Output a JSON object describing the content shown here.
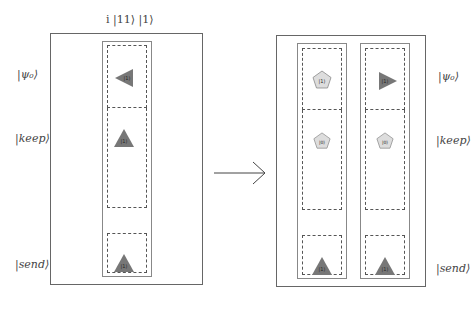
{
  "title": "i |11⟩ |1⟩",
  "row_labels": {
    "psi0": "|ψ₀⟩",
    "keep": "|keep⟩",
    "send": "|send⟩"
  },
  "colors": {
    "triangle_fill": "#777777",
    "pentagon_fill": "#dddddd",
    "pentagon_stroke": "#888888",
    "frame": "#666666"
  },
  "before": {
    "column": {
      "psi0": {
        "shape": "triangle-left",
        "label": "|1⟩"
      },
      "keep": {
        "shape": "triangle-up",
        "label": "|1⟩"
      },
      "send": {
        "shape": "triangle-up",
        "label": "|1⟩"
      }
    }
  },
  "arrow": {
    "direction": "right"
  },
  "after": {
    "columns": [
      {
        "psi0": {
          "shape": "pentagon",
          "label": "|1⟩"
        },
        "keep": {
          "shape": "pentagon",
          "label": "|0⟩"
        },
        "send": {
          "shape": "triangle-up",
          "label": "|1⟩"
        }
      },
      {
        "psi0": {
          "shape": "triangle-right",
          "label": "|1⟩"
        },
        "keep": {
          "shape": "pentagon",
          "label": "|0⟩"
        },
        "send": {
          "shape": "triangle-up",
          "label": "|1⟩"
        }
      }
    ]
  }
}
